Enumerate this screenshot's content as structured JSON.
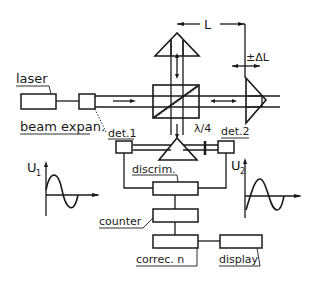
{
  "diagram": {
    "labels": {
      "laser": "laser",
      "beam_expander": "beam expan.",
      "det1": "det.1",
      "det2": "det.2",
      "discriminator": "discrim.",
      "counter": "counter",
      "correction": "correc. n",
      "display": "display",
      "length": "L",
      "delta_length": "±ΔL",
      "quarter_wave": "λ/4",
      "signal1": "U",
      "signal1_sub": "1",
      "signal2": "U",
      "signal2_sub": "2"
    },
    "components": [
      {
        "id": "laser",
        "type": "box"
      },
      {
        "id": "beam_expander",
        "type": "box"
      },
      {
        "id": "beam_splitter",
        "type": "cube-with-diagonal"
      },
      {
        "id": "reference_prism",
        "type": "triangle-top"
      },
      {
        "id": "measuring_prism",
        "type": "triangle-right-movable"
      },
      {
        "id": "detector_prism",
        "type": "triangle-bottom"
      },
      {
        "id": "det1",
        "type": "small-box"
      },
      {
        "id": "det2",
        "type": "small-box"
      },
      {
        "id": "quarter_wave_plate",
        "type": "plate"
      },
      {
        "id": "discriminator",
        "type": "box"
      },
      {
        "id": "counter",
        "type": "box"
      },
      {
        "id": "correction",
        "type": "box"
      },
      {
        "id": "display",
        "type": "box"
      }
    ],
    "signals": [
      {
        "name": "U1",
        "shape": "sine",
        "side": "left"
      },
      {
        "name": "U2",
        "shape": "sine-phase-shifted",
        "side": "right"
      }
    ],
    "colors": {
      "ink": "#1a1a1a",
      "background": "#ffffff"
    }
  }
}
